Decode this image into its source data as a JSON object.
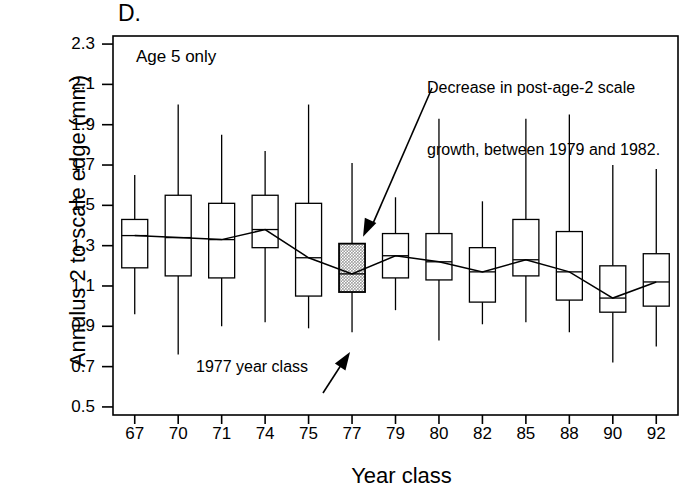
{
  "figure": {
    "panel_letter": "D.",
    "series_note": "Age 5 only",
    "xlabel": "Year class",
    "ylabel": "Annulus 2 to scale edge (mm)",
    "annotations": [
      {
        "name": "decrease-annotation",
        "line1": "Decrease in post-age-2 scale",
        "line2": "growth, between 1979 and 1982."
      },
      {
        "name": "year-class-annotation",
        "text": "1977 year class"
      }
    ],
    "highlight_color": "#9a9a9a",
    "line_color": "#000000"
  },
  "chart_data": {
    "type": "box",
    "title": "Age 5 only",
    "xlabel": "Year class",
    "ylabel": "Annulus 2 to scale edge (mm)",
    "ylim": [
      0.46,
      2.34
    ],
    "yticks": [
      2.3,
      2.1,
      1.9,
      1.7,
      1.5,
      1.3,
      1.1,
      0.9,
      0.7,
      0.5
    ],
    "ytick_labels": [
      "2.3",
      "2.1",
      "1.9",
      "1.7",
      "1.5",
      "1.3",
      "1.1",
      "0.9",
      "0.7",
      "0.5"
    ],
    "grid": false,
    "legend": "none",
    "categories": [
      "67",
      "70",
      "71",
      "74",
      "75",
      "77",
      "79",
      "80",
      "82",
      "85",
      "88",
      "90",
      "92"
    ],
    "highlighted_category": "77",
    "boxes": [
      {
        "category": "67",
        "whisker_low": 0.96,
        "q1": 1.19,
        "median": 1.35,
        "q3": 1.43,
        "whisker_high": 1.65
      },
      {
        "category": "70",
        "whisker_low": 0.76,
        "q1": 1.15,
        "median": 1.34,
        "q3": 1.55,
        "whisker_high": 2.0
      },
      {
        "category": "71",
        "whisker_low": 0.9,
        "q1": 1.14,
        "median": 1.33,
        "q3": 1.51,
        "whisker_high": 1.85
      },
      {
        "category": "74",
        "whisker_low": 0.92,
        "q1": 1.29,
        "median": 1.38,
        "q3": 1.55,
        "whisker_high": 1.77
      },
      {
        "category": "75",
        "whisker_low": 0.89,
        "q1": 1.05,
        "median": 1.24,
        "q3": 1.51,
        "whisker_high": 2.0
      },
      {
        "category": "77",
        "whisker_low": 0.87,
        "q1": 1.07,
        "median": 1.16,
        "q3": 1.31,
        "whisker_high": 1.71
      },
      {
        "category": "79",
        "whisker_low": 0.98,
        "q1": 1.14,
        "median": 1.25,
        "q3": 1.36,
        "whisker_high": 1.54
      },
      {
        "category": "80",
        "whisker_low": 0.83,
        "q1": 1.13,
        "median": 1.22,
        "q3": 1.36,
        "whisker_high": 1.93
      },
      {
        "category": "82",
        "whisker_low": 0.91,
        "q1": 1.02,
        "median": 1.17,
        "q3": 1.29,
        "whisker_high": 1.52
      },
      {
        "category": "85",
        "whisker_low": 0.92,
        "q1": 1.15,
        "median": 1.23,
        "q3": 1.43,
        "whisker_high": 1.93
      },
      {
        "category": "88",
        "whisker_low": 0.87,
        "q1": 1.03,
        "median": 1.17,
        "q3": 1.37,
        "whisker_high": 1.95
      },
      {
        "category": "90",
        "whisker_low": 0.72,
        "q1": 0.97,
        "median": 1.04,
        "q3": 1.2,
        "whisker_high": 1.7
      },
      {
        "category": "92",
        "whisker_low": 0.8,
        "q1": 1.0,
        "median": 1.12,
        "q3": 1.26,
        "whisker_high": 1.68
      }
    ],
    "median_line_series": {
      "name": "median trend",
      "values": [
        1.35,
        1.34,
        1.33,
        1.38,
        1.24,
        1.16,
        1.25,
        1.22,
        1.17,
        1.23,
        1.17,
        1.04,
        1.12
      ]
    }
  }
}
